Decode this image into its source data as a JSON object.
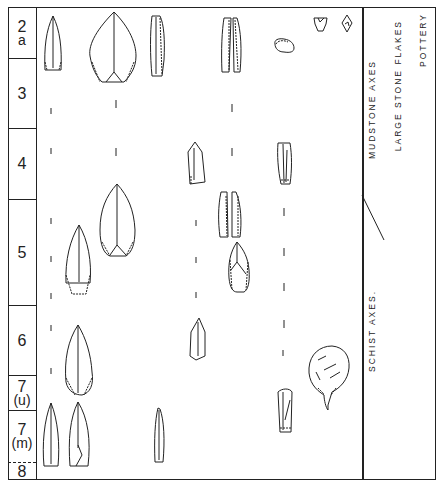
{
  "layers": [
    {
      "id": "2a",
      "main": "2",
      "sub": "a",
      "top": 0,
      "height": 51
    },
    {
      "id": "3",
      "main": "3",
      "sub": "",
      "top": 51,
      "height": 70
    },
    {
      "id": "4",
      "main": "4",
      "sub": "",
      "top": 121,
      "height": 71
    },
    {
      "id": "5",
      "main": "5",
      "sub": "",
      "top": 192,
      "height": 106
    },
    {
      "id": "6",
      "main": "6",
      "sub": "",
      "top": 298,
      "height": 70
    },
    {
      "id": "7u",
      "main": "7",
      "sub": "(u)",
      "top": 368,
      "height": 35
    },
    {
      "id": "7m",
      "main": "7",
      "sub": "(m)",
      "top": 403,
      "height": 52
    },
    {
      "id": "8",
      "main": "8",
      "sub": "",
      "top": 455,
      "height": 18
    }
  ],
  "category_labels": [
    {
      "text": "MUDSTONE   AXES",
      "x": 368,
      "y": 55,
      "h": 110
    },
    {
      "text": "LARGE  STONE  FLAKES",
      "x": 392,
      "y": 20,
      "h": 135
    },
    {
      "text": "POTTERY",
      "x": 418,
      "y": 15,
      "h": 52
    },
    {
      "text": "SCHIST   AXES.",
      "x": 368,
      "y": 290,
      "h": 100
    }
  ],
  "colors": {
    "ink": "#222222",
    "background": "#ffffff"
  }
}
